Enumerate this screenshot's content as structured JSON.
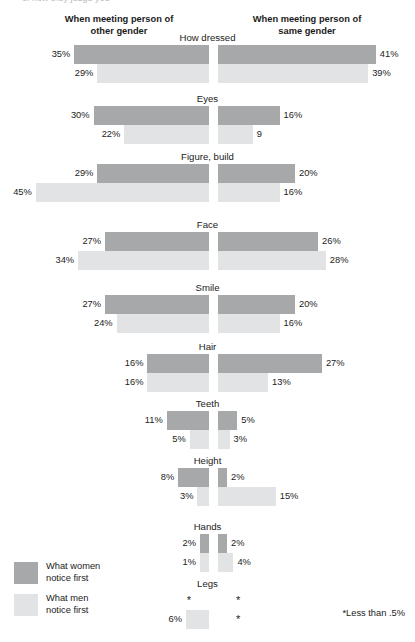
{
  "top_sliver": "of how they judge you",
  "headers": {
    "left_line1": "When meeting person of",
    "left_line2": "other gender",
    "right_line1": "When meeting person of",
    "right_line2": "same gender"
  },
  "legend": {
    "items": [
      {
        "key": "women",
        "line1": "What women",
        "line2": "notice first",
        "color": "#a7a8aa"
      },
      {
        "key": "men",
        "line1": "What men",
        "line2": "notice first",
        "color": "#e2e3e4"
      }
    ]
  },
  "footnote": "*Less than .5%",
  "colors": {
    "women": "#a7a8aa",
    "men": "#e2e3e4",
    "text": "#1b1b1b"
  },
  "chart_data": {
    "type": "bar",
    "title": "",
    "subtitle": "",
    "xlabel": "",
    "ylabel": "",
    "orientation": "horizontal-diverging",
    "grid": false,
    "legend_position": "bottom-left",
    "axis_note": "*Less than .5%",
    "panels": [
      "When meeting person of other gender",
      "When meeting person of same gender"
    ],
    "series": [
      {
        "name": "What women notice first",
        "color": "#a7a8aa"
      },
      {
        "name": "What men notice first",
        "color": "#e2e3e4"
      }
    ],
    "categories": [
      "How dressed",
      "Eyes",
      "Figure, build",
      "Face",
      "Smile",
      "Hair",
      "Teeth",
      "Height",
      "Hands",
      "Legs"
    ],
    "rows": [
      {
        "category": "How dressed",
        "other_gender": {
          "women": {
            "value": 35,
            "label": "35%"
          },
          "men": {
            "value": 29,
            "label": "29%"
          }
        },
        "same_gender": {
          "women": {
            "value": 41,
            "label": "41%"
          },
          "men": {
            "value": 39,
            "label": "39%"
          }
        }
      },
      {
        "category": "Eyes",
        "other_gender": {
          "women": {
            "value": 30,
            "label": "30%"
          },
          "men": {
            "value": 22,
            "label": "22%"
          }
        },
        "same_gender": {
          "women": {
            "value": 16,
            "label": "16%"
          },
          "men": {
            "value": 9,
            "label": "9"
          }
        }
      },
      {
        "category": "Figure, build",
        "other_gender": {
          "women": {
            "value": 29,
            "label": "29%"
          },
          "men": {
            "value": 45,
            "label": "45%"
          }
        },
        "same_gender": {
          "women": {
            "value": 20,
            "label": "20%"
          },
          "men": {
            "value": 16,
            "label": "16%"
          }
        }
      },
      {
        "category": "Face",
        "other_gender": {
          "women": {
            "value": 27,
            "label": "27%"
          },
          "men": {
            "value": 34,
            "label": "34%"
          }
        },
        "same_gender": {
          "women": {
            "value": 26,
            "label": "26%"
          },
          "men": {
            "value": 28,
            "label": "28%"
          }
        }
      },
      {
        "category": "Smile",
        "other_gender": {
          "women": {
            "value": 27,
            "label": "27%"
          },
          "men": {
            "value": 24,
            "label": "24%"
          }
        },
        "same_gender": {
          "women": {
            "value": 20,
            "label": "20%"
          },
          "men": {
            "value": 16,
            "label": "16%"
          }
        }
      },
      {
        "category": "Hair",
        "other_gender": {
          "women": {
            "value": 16,
            "label": "16%"
          },
          "men": {
            "value": 16,
            "label": "16%"
          }
        },
        "same_gender": {
          "women": {
            "value": 27,
            "label": "27%"
          },
          "men": {
            "value": 13,
            "label": "13%"
          }
        }
      },
      {
        "category": "Teeth",
        "other_gender": {
          "women": {
            "value": 11,
            "label": "11%"
          },
          "men": {
            "value": 5,
            "label": "5%"
          }
        },
        "same_gender": {
          "women": {
            "value": 5,
            "label": "5%"
          },
          "men": {
            "value": 3,
            "label": "3%"
          }
        }
      },
      {
        "category": "Height",
        "other_gender": {
          "women": {
            "value": 8,
            "label": "8%"
          },
          "men": {
            "value": 3,
            "label": "3%"
          }
        },
        "same_gender": {
          "women": {
            "value": 2,
            "label": "2%"
          },
          "men": {
            "value": 15,
            "label": "15%"
          }
        }
      },
      {
        "category": "Hands",
        "other_gender": {
          "women": {
            "value": 2,
            "label": "2%"
          },
          "men": {
            "value": 1,
            "label": "1%"
          }
        },
        "same_gender": {
          "women": {
            "value": 2,
            "label": "2%"
          },
          "men": {
            "value": 4,
            "label": "4%"
          }
        }
      },
      {
        "category": "Legs",
        "other_gender": {
          "women": {
            "value": 0.4,
            "label": "*"
          },
          "men": {
            "value": 6,
            "label": "6%"
          }
        },
        "same_gender": {
          "women": {
            "value": 0.4,
            "label": "*"
          },
          "men": {
            "value": 0.4,
            "label": "*"
          }
        }
      }
    ]
  }
}
